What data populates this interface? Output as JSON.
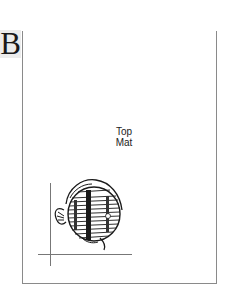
{
  "figure": {
    "label": "B"
  },
  "page": {
    "mat_label_line1": "Top",
    "mat_label_line2": "Mat"
  },
  "illustration": {
    "subject": "discus-fish",
    "icon": "fish-icon"
  },
  "colors": {
    "frame": "#8a8a8a",
    "label_bg": "#ececec",
    "ink": "#1a1a1a"
  }
}
